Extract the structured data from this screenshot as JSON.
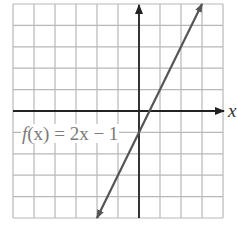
{
  "chart_data": {
    "type": "line",
    "title": "",
    "function_label": {
      "name_part": "f",
      "arg_part": "(x)",
      "rest": " = 2x − 1",
      "full": "f(x) = 2x − 1"
    },
    "xlabel": "x",
    "ylabel": "",
    "xlim": [
      -6,
      4
    ],
    "ylim": [
      -5,
      5
    ],
    "grid": true,
    "grid_step": 1,
    "legend": null,
    "series": [
      {
        "name": "f(x) = 2x − 1",
        "slope": 2,
        "intercept": -1,
        "x": [
          -2,
          3
        ],
        "y": [
          -5,
          5
        ],
        "arrows_both_ends": true
      }
    ],
    "annotations": [
      {
        "text": "f(x) = 2x − 1",
        "near": [
          -5,
          -1
        ]
      }
    ]
  },
  "colors": {
    "grid": "#b8b8b8",
    "axis": "#222222",
    "line": "#555555",
    "label": "#7a7a7a"
  },
  "layout": {
    "px_left": 13,
    "px_right": 223,
    "px_top": 4,
    "px_bottom": 218
  }
}
